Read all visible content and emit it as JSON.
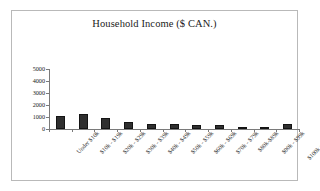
{
  "chart_data": {
    "type": "bar",
    "title": "Household Income ($ CAN.)",
    "xlabel": "",
    "ylabel": "",
    "grid": false,
    "legend": false,
    "ylim": [
      0,
      5000
    ],
    "ytick_labels": [
      "5000",
      "4000",
      "3000",
      "2000",
      "1000",
      "0"
    ],
    "yticks": [
      5000,
      4000,
      3000,
      2000,
      1000,
      0
    ],
    "categories": [
      "Under $10k",
      "$10k - $19k",
      "$20k - $29k",
      "$30k - $39k",
      "$40k - $49k",
      "$50k - $59k",
      "$60k - $69k",
      "$70k - $79k",
      "$80k-$89k",
      "$90k - $99k",
      "$100k and over"
    ],
    "values": [
      1100,
      1250,
      950,
      620,
      380,
      380,
      300,
      300,
      120,
      100,
      400
    ],
    "bar_color": "#2f2f2f",
    "axis_color": "#7a7a7a",
    "background_color": "#ffffff",
    "border_color": "#b9b9b9"
  }
}
